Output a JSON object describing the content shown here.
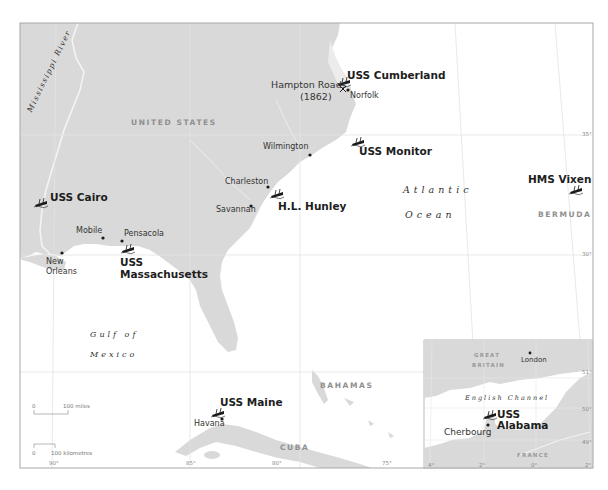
{
  "colors": {
    "land": "#d9d9d9",
    "sea": "#ffffff",
    "frame": "#a8a8a8",
    "grid": "#e4e4e4",
    "river": "#f2f2f2",
    "text": "#2a2a2a",
    "country_text": "#8f8f8f"
  },
  "countries": {
    "united_states": "UNITED STATES",
    "bahamas": "BAHAMAS",
    "cuba": "CUBA",
    "bermuda": "BERMUDA"
  },
  "water_bodies": {
    "river": "Mississippi River",
    "atlantic_1": "Atlantic",
    "atlantic_2": "Ocean",
    "gulf_1": "Gulf of",
    "gulf_2": "Mexico"
  },
  "cities": {
    "norfolk": "Norfolk",
    "hampton_roads_1": "Hampton Roads",
    "hampton_roads_2": "(1862)",
    "wilmington": "Wilmington",
    "charleston": "Charleston",
    "savannah": "Savannah",
    "mobile": "Mobile",
    "pensacola": "Pensacola",
    "new_orleans_1": "New",
    "new_orleans_2": "Orleans",
    "havana": "Havana"
  },
  "ships": [
    {
      "name": "USS Cumberland",
      "icon": "shipwreck-icon"
    },
    {
      "name": "USS Monitor",
      "icon": "shipwreck-icon"
    },
    {
      "name": "USS Cairo",
      "icon": "shipwreck-icon"
    },
    {
      "name": "H.L. Hunley",
      "icon": "shipwreck-icon"
    },
    {
      "name": "HMS Vixen",
      "icon": "shipwreck-icon"
    },
    {
      "name_1": "USS",
      "name_2": "Massachusetts",
      "icon": "shipwreck-icon"
    },
    {
      "name": "USS Maine",
      "icon": "shipwreck-icon"
    },
    {
      "name_1": "USS",
      "name_2": "Alabama",
      "icon": "shipwreck-icon"
    }
  ],
  "inset": {
    "great_britain_1": "GREAT",
    "great_britain_2": "BRITAIN",
    "london": "London",
    "channel": "English Channel",
    "cherbourg": "Cherbourg",
    "france": "FRANCE",
    "lon_ticks": [
      "4°",
      "2°",
      "0°",
      "2°"
    ],
    "lat_ticks": [
      "51°",
      "50°",
      "49°"
    ]
  },
  "graticule": {
    "lon_ticks": [
      "90°",
      "85°",
      "80°",
      "75°"
    ],
    "lat_ticks": [
      "35°",
      "30°"
    ]
  },
  "scale_bar": {
    "miles_zero": "0",
    "miles_label": "100 miles",
    "km_zero": "0",
    "km_label": "100 kilometres"
  }
}
